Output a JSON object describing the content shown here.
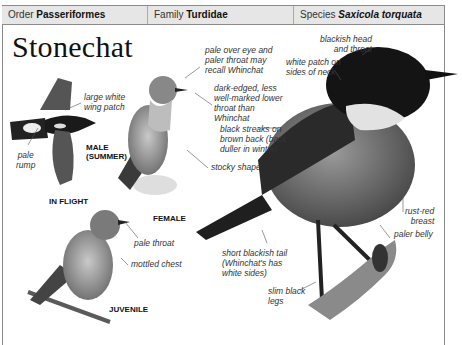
{
  "header": {
    "order_label": "Order",
    "order_value": "Passeriformes",
    "family_label": "Family",
    "family_value": "Turdidae",
    "species_label": "Species",
    "species_value": "Saxicola torquata"
  },
  "title": "Stonechat",
  "captions": {
    "male_summer_1": "MALE",
    "male_summer_2": "(SUMMER)",
    "in_flight": "IN FLIGHT",
    "female": "FEMALE",
    "juvenile": "JUVENILE"
  },
  "labels": {
    "wing_patch": [
      "large white",
      "wing patch"
    ],
    "pale_rump": [
      "pale",
      "rump"
    ],
    "pale_over_eye": [
      "pale over eye and",
      "paler throat may",
      "recall Whinchat"
    ],
    "dark_edged": [
      "dark-edged, less",
      "well-marked lower",
      "throat than",
      "Whinchat"
    ],
    "black_streaks": [
      "black streaks on",
      "brown back (back",
      "duller in winter)"
    ],
    "stocky_shape": "stocky shape",
    "blackish_head": [
      "blackish head",
      "and throat"
    ],
    "white_patch": [
      "white patch on",
      "sides of neck"
    ],
    "rust_red": [
      "rust-red",
      "breast"
    ],
    "paler_belly": "paler belly",
    "short_tail": [
      "short blackish tail",
      "(Whinchat's has",
      "white sides)"
    ],
    "slim_legs": [
      "slim black",
      "legs"
    ],
    "pale_throat": "pale throat",
    "mottled_chest": "mottled chest"
  }
}
